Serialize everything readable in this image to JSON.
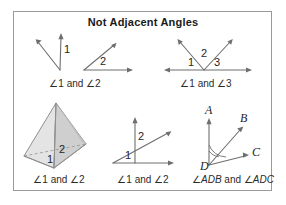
{
  "figure": {
    "title": "Not Adjacent Angles",
    "border_color": "#9a9a9a",
    "background": "#ffffff",
    "line_color": "#6e6e6e",
    "label_color": "#1f1f1f"
  },
  "panels": {
    "top_left": {
      "caption": "∠1 and ∠2",
      "angle_labels": [
        "1",
        "2"
      ],
      "description": "two separate angles, no common vertex"
    },
    "top_right": {
      "caption": "∠1 and ∠3",
      "angle_labels": [
        "1",
        "2",
        "3"
      ],
      "description": "three angles on a line sharing a vertex"
    },
    "bottom_left": {
      "caption": "∠1 and ∠2",
      "angle_labels": [
        "1",
        "2"
      ],
      "description": "pyramid solid with two face angles"
    },
    "bottom_middle": {
      "caption": "∠1 and ∠2",
      "angle_labels": [
        "1",
        "2"
      ],
      "description": "ray crossed by a vertical line"
    },
    "bottom_right": {
      "caption_parts": {
        "pre": "∠",
        "first": "ADB",
        "mid": " and ∠",
        "second": "ADC"
      },
      "caption": "∠ADB and ∠ADC",
      "point_labels": [
        "A",
        "B",
        "C",
        "D"
      ],
      "description": "overlapping angles ADB and ADC at vertex D"
    }
  },
  "colors": {
    "stroke": "#6e6e6e",
    "pyramid_light": "#e9e9e9",
    "pyramid_mid": "#d3d3d3",
    "pyramid_dark": "#bdbdbd",
    "text": "#1f1f1f",
    "frame": "#9a9a9a"
  }
}
